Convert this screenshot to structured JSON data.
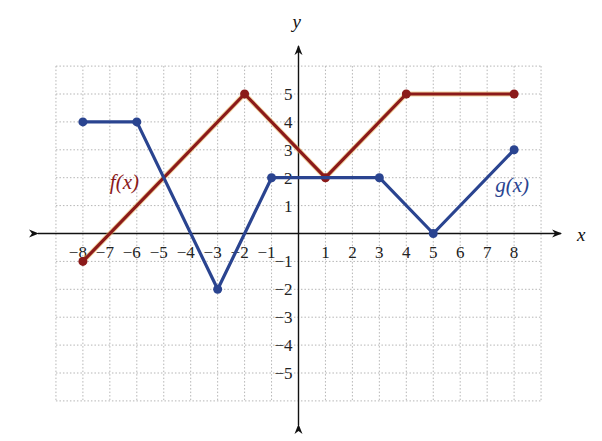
{
  "chart_data": {
    "type": "line",
    "title": "",
    "xlabel": "x",
    "ylabel": "y",
    "xlim": [
      -9,
      9
    ],
    "ylim": [
      -6,
      6
    ],
    "grid": true,
    "x_ticks": [
      -8,
      -7,
      -6,
      -5,
      -4,
      -3,
      -2,
      -1,
      1,
      2,
      3,
      4,
      5,
      6,
      7,
      8
    ],
    "y_ticks": [
      -5,
      -4,
      -3,
      -2,
      -1,
      1,
      2,
      3,
      4,
      5
    ],
    "series": [
      {
        "name": "f(x)",
        "color": "#8b1a1a",
        "label_position": [
          -7,
          1.6
        ],
        "points": [
          [
            -8,
            -1
          ],
          [
            -2,
            5
          ],
          [
            1,
            2
          ],
          [
            4,
            5
          ],
          [
            8,
            5
          ]
        ],
        "endpoints": [
          [
            -8,
            -1
          ],
          [
            -2,
            5
          ],
          [
            1,
            2
          ],
          [
            4,
            5
          ],
          [
            8,
            5
          ]
        ]
      },
      {
        "name": "g(x)",
        "color": "#2a4490",
        "label_position": [
          7.3,
          1.5
        ],
        "points": [
          [
            -8,
            4
          ],
          [
            -6,
            4
          ],
          [
            -3,
            -2
          ],
          [
            -1,
            2
          ],
          [
            3,
            2
          ],
          [
            5,
            0
          ],
          [
            8,
            3
          ]
        ],
        "endpoints": [
          [
            -8,
            4
          ],
          [
            -6,
            4
          ],
          [
            -3,
            -2
          ],
          [
            -1,
            2
          ],
          [
            3,
            2
          ],
          [
            5,
            0
          ],
          [
            8,
            3
          ]
        ]
      }
    ],
    "legend": "inline labels"
  },
  "layout": {
    "origin_px": [
      298.5,
      233.5
    ],
    "unit_x_px": 26.95,
    "unit_y_px": 27.9
  }
}
